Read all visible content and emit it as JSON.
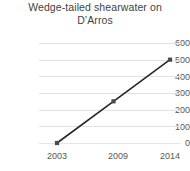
{
  "chart_data": {
    "type": "line",
    "title_line1": "Wedge-tailed shearwater on",
    "title_line2": "D’Arros",
    "categories": [
      "2003",
      "2009",
      "2014"
    ],
    "values": [
      0,
      250,
      500
    ],
    "series": [
      {
        "name": "Wedge-tailed shearwater",
        "values": [
          0,
          250,
          500
        ]
      }
    ],
    "xlabel": "",
    "ylabel": "",
    "ylim": [
      0,
      600
    ],
    "ytick_step": 100,
    "yticks": [
      "600",
      "500",
      "400",
      "300",
      "200",
      "100",
      "0"
    ],
    "grid": true,
    "legend": "none",
    "marker": "square",
    "colors": {
      "line": "#262626",
      "marker": "#4a4a4a",
      "gridline": "#e2e2e2",
      "text": "#575757",
      "title": "#3f3f3f",
      "background": "#ffffff"
    }
  }
}
